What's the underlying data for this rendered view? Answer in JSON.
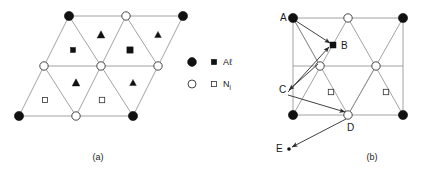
{
  "figure": {
    "panels": [
      {
        "id": "a",
        "caption": "(a)",
        "caption_x": 98,
        "caption_y": 160,
        "description": "triangular lattice"
      },
      {
        "id": "b",
        "caption": "(b)",
        "caption_x": 372,
        "caption_y": 160,
        "description": "rectangular lattice with migration vectors"
      }
    ],
    "legend": {
      "x": 192,
      "y": 62,
      "entries": [
        {
          "circle_marker": "filled-circle",
          "square_marker": "filled-square",
          "label": "A",
          "label_tail": "ℓ",
          "label_sub": "",
          "species": "Al"
        },
        {
          "circle_marker": "open-circle",
          "square_marker": "open-square",
          "label": "N",
          "label_tail": "",
          "label_sub": "i",
          "species": "Ni"
        }
      ]
    },
    "panel_a": {
      "nodes": [
        {
          "cx": 69,
          "cy": 16,
          "type": "filled-circle",
          "r": 4.6
        },
        {
          "cx": 126,
          "cy": 16,
          "type": "open-circle",
          "r": 4.2
        },
        {
          "cx": 183,
          "cy": 16,
          "type": "filled-circle",
          "r": 4.6
        },
        {
          "cx": 44,
          "cy": 66,
          "type": "open-circle",
          "r": 4.2
        },
        {
          "cx": 101,
          "cy": 66,
          "type": "open-circle",
          "r": 4.2
        },
        {
          "cx": 158,
          "cy": 66,
          "type": "open-circle",
          "r": 4.2
        },
        {
          "cx": 19,
          "cy": 116,
          "type": "filled-circle",
          "r": 4.6
        },
        {
          "cx": 76,
          "cy": 116,
          "type": "open-circle",
          "r": 4.2
        },
        {
          "cx": 133,
          "cy": 116,
          "type": "filled-circle",
          "r": 4.6
        }
      ],
      "lines": [
        {
          "x1": 69,
          "y1": 16,
          "x2": 183,
          "y2": 16
        },
        {
          "x1": 44,
          "y1": 66,
          "x2": 158,
          "y2": 66
        },
        {
          "x1": 19,
          "y1": 116,
          "x2": 133,
          "y2": 116
        },
        {
          "x1": 69,
          "y1": 16,
          "x2": 19,
          "y2": 116
        },
        {
          "x1": 126,
          "y1": 16,
          "x2": 76,
          "y2": 116
        },
        {
          "x1": 183,
          "y1": 16,
          "x2": 133,
          "y2": 116
        },
        {
          "x1": 69,
          "y1": 16,
          "x2": 101,
          "y2": 66
        },
        {
          "x1": 126,
          "y1": 16,
          "x2": 158,
          "y2": 66
        },
        {
          "x1": 44,
          "y1": 66,
          "x2": 76,
          "y2": 116
        },
        {
          "x1": 101,
          "y1": 66,
          "x2": 133,
          "y2": 116
        }
      ],
      "triangles": [
        {
          "cx": 101,
          "cy": 35,
          "size": 4.2,
          "type": "filled-triangle"
        },
        {
          "cx": 158,
          "cy": 35,
          "size": 3.6,
          "type": "filled-triangle"
        },
        {
          "cx": 76,
          "cy": 83,
          "size": 4.2,
          "type": "filled-triangle"
        },
        {
          "cx": 133,
          "cy": 83,
          "size": 3.6,
          "type": "filled-triangle"
        }
      ],
      "squares": [
        {
          "cx": 73,
          "cy": 50,
          "size": 5.0,
          "type": "filled-square"
        },
        {
          "cx": 130,
          "cy": 50,
          "size": 6.2,
          "type": "filled-square"
        },
        {
          "cx": 45,
          "cy": 100,
          "size": 5.0,
          "type": "open-square"
        },
        {
          "cx": 102,
          "cy": 100,
          "size": 5.4,
          "type": "open-square"
        }
      ]
    },
    "panel_b": {
      "nodes": [
        {
          "cx": 293,
          "cy": 18,
          "type": "filled-circle",
          "r": 4.6
        },
        {
          "cx": 348,
          "cy": 18,
          "type": "open-circle",
          "r": 4.2
        },
        {
          "cx": 403,
          "cy": 18,
          "type": "filled-circle",
          "r": 4.6
        },
        {
          "cx": 320,
          "cy": 66,
          "type": "open-circle",
          "r": 4.2
        },
        {
          "cx": 376,
          "cy": 66,
          "type": "open-circle",
          "r": 4.2
        },
        {
          "cx": 293,
          "cy": 115,
          "type": "filled-circle",
          "r": 4.6
        },
        {
          "cx": 348,
          "cy": 115,
          "type": "open-circle",
          "r": 4.2
        },
        {
          "cx": 403,
          "cy": 115,
          "type": "filled-circle",
          "r": 4.6
        }
      ],
      "lines": [
        {
          "x1": 293,
          "y1": 18,
          "x2": 403,
          "y2": 18
        },
        {
          "x1": 293,
          "y1": 66,
          "x2": 403,
          "y2": 66
        },
        {
          "x1": 293,
          "y1": 115,
          "x2": 403,
          "y2": 115
        },
        {
          "x1": 293,
          "y1": 18,
          "x2": 293,
          "y2": 115
        },
        {
          "x1": 403,
          "y1": 18,
          "x2": 403,
          "y2": 115
        },
        {
          "x1": 293,
          "y1": 18,
          "x2": 348,
          "y2": 115
        },
        {
          "x1": 348,
          "y1": 18,
          "x2": 293,
          "y2": 115
        },
        {
          "x1": 348,
          "y1": 18,
          "x2": 403,
          "y2": 115
        },
        {
          "x1": 403,
          "y1": 18,
          "x2": 348,
          "y2": 115
        },
        {
          "x1": 293,
          "y1": 18,
          "x2": 320,
          "y2": 66
        },
        {
          "x1": 348,
          "y1": 115,
          "x2": 376,
          "y2": 66
        }
      ],
      "squares": [
        {
          "cx": 333,
          "cy": 45,
          "size": 6.0,
          "type": "filled-square"
        },
        {
          "cx": 331,
          "cy": 92,
          "size": 5.4,
          "type": "open-square"
        },
        {
          "cx": 386,
          "cy": 92,
          "size": 5.4,
          "type": "open-square"
        }
      ],
      "dots": [
        {
          "cx": 289,
          "cy": 149,
          "r": 1.6,
          "type": "tiny-dot"
        }
      ],
      "point_labels": [
        {
          "id": "A",
          "text": "A",
          "x": 280,
          "y": 21
        },
        {
          "id": "B",
          "text": "B",
          "x": 341,
          "y": 49
        },
        {
          "id": "C",
          "text": "C",
          "x": 279,
          "y": 93
        },
        {
          "id": "D",
          "text": "D",
          "x": 347,
          "y": 131
        },
        {
          "id": "E",
          "text": "E",
          "x": 276,
          "y": 152
        }
      ],
      "arrows": [
        {
          "name": "arrow-a-to-b",
          "from": "A",
          "to": "B",
          "x1": 296,
          "y1": 21,
          "x2": 330,
          "y2": 43
        },
        {
          "name": "arrow-center-to-c",
          "from": "center",
          "to": "C",
          "x1": 318,
          "y1": 64,
          "x2": 289,
          "y2": 90
        },
        {
          "name": "arrow-c-to-b",
          "from": "C",
          "to": "B",
          "x1": 288,
          "y1": 92,
          "x2": 329,
          "y2": 47
        },
        {
          "name": "arrow-c-to-d",
          "from": "C",
          "to": "D",
          "x1": 288,
          "y1": 95,
          "x2": 345,
          "y2": 112
        },
        {
          "name": "arrow-d-to-e",
          "from": "D",
          "to": "E",
          "x1": 346,
          "y1": 119,
          "x2": 292,
          "y2": 147
        }
      ]
    }
  }
}
